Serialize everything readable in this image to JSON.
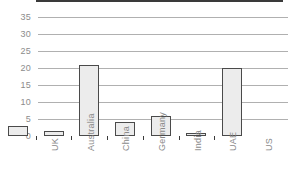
{
  "chart_data": {
    "type": "bar",
    "title": "",
    "subtitle": "",
    "xlabel": "",
    "ylabel": "",
    "categories": [
      "UK",
      "Australia",
      "China",
      "Germany",
      "India",
      "UAE",
      "US"
    ],
    "values": [
      3,
      1.5,
      21,
      4,
      6,
      1,
      20
    ],
    "series": [
      {
        "name": "",
        "values": [
          3,
          1.5,
          21,
          4,
          6,
          1,
          20
        ]
      }
    ],
    "ylim": [
      0,
      35
    ],
    "ytick_labels": [
      "0",
      "5",
      "10",
      "15",
      "20",
      "25",
      "30",
      "35"
    ],
    "ytick_values": [
      0,
      5,
      10,
      15,
      20,
      25,
      30,
      35
    ],
    "grid": true,
    "grid_axis": "y",
    "legend": false,
    "legend_position": "none",
    "annotations": [],
    "xtick_rotation": 90
  },
  "style": {
    "background_color": "#ffffff",
    "bar_fill_color": "#ececec",
    "bar_border_color": "#4a4a4a",
    "gridline_color": "#b0b0b0",
    "axis_color": "#3a3a3a",
    "tick_label_color": "#8c8c8c",
    "category_label_color": "#8a8a8a"
  }
}
